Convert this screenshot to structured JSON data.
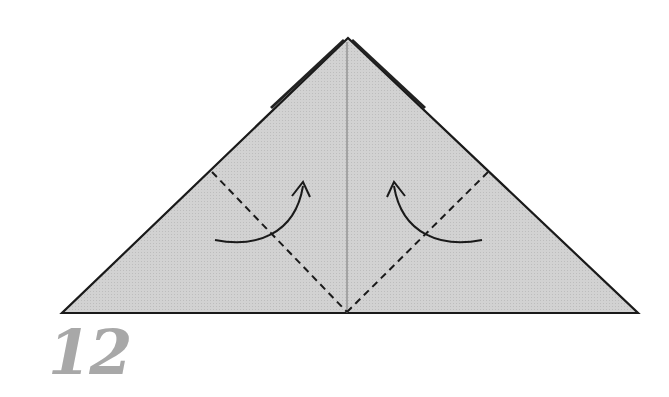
{
  "diagram": {
    "type": "origami-step",
    "step_number": "12",
    "colors": {
      "paper_fill": "#cfcfcf",
      "outline": "#1a1a1a",
      "crease": "#8a8a8a",
      "step_number": "#a8a8a8"
    },
    "shape": "triangle",
    "annotations": [
      {
        "type": "valley-fold-line",
        "side": "left"
      },
      {
        "type": "valley-fold-line",
        "side": "right"
      },
      {
        "type": "fold-arrow",
        "side": "left",
        "direction": "up-right"
      },
      {
        "type": "fold-arrow",
        "side": "right",
        "direction": "up-left"
      }
    ]
  }
}
